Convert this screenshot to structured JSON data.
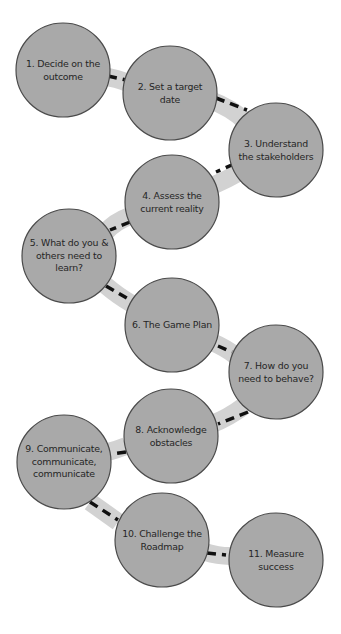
{
  "diagram": {
    "type": "roadmap-path",
    "colors": {
      "background": "#ffffff",
      "node_fill": "#a9a9a9",
      "node_stroke": "#4a4a4a",
      "path_band": "#d2d2d2",
      "path_dash": "#111111",
      "label_text": "#262626"
    },
    "node_radius": 47,
    "nodes": [
      {
        "id": 1,
        "label": "1. Decide on the\noutcome",
        "cx": 63,
        "cy": 70
      },
      {
        "id": 2,
        "label": "2. Set a target\ndate",
        "cx": 170,
        "cy": 93
      },
      {
        "id": 3,
        "label": "3. Understand\nthe stakeholders",
        "cx": 276,
        "cy": 150
      },
      {
        "id": 4,
        "label": "4. Assess the\ncurrent reality",
        "cx": 172,
        "cy": 202
      },
      {
        "id": 5,
        "label": "5. What do you &\nothers need to\nlearn?",
        "cx": 69,
        "cy": 256
      },
      {
        "id": 6,
        "label": "6. The Game Plan",
        "cx": 172,
        "cy": 325
      },
      {
        "id": 7,
        "label": "7. How do you\nneed to behave?",
        "cx": 276,
        "cy": 372
      },
      {
        "id": 8,
        "label": "8. Acknowledge\nobstacles",
        "cx": 171,
        "cy": 436
      },
      {
        "id": 9,
        "label": "9. Communicate,\ncommunicate,\ncommunicate",
        "cx": 64,
        "cy": 462
      },
      {
        "id": 10,
        "label": "10. Challenge the\nRoadmap",
        "cx": 162,
        "cy": 540
      },
      {
        "id": 11,
        "label": "11. Measure\nsuccess",
        "cx": 276,
        "cy": 560
      }
    ],
    "edges": [
      {
        "from": 1,
        "to": 2
      },
      {
        "from": 2,
        "to": 3
      },
      {
        "from": 3,
        "to": 4
      },
      {
        "from": 4,
        "to": 5
      },
      {
        "from": 5,
        "to": 6
      },
      {
        "from": 6,
        "to": 7
      },
      {
        "from": 7,
        "to": 8
      },
      {
        "from": 8,
        "to": 9
      },
      {
        "from": 9,
        "to": 10
      },
      {
        "from": 10,
        "to": 11
      }
    ]
  }
}
